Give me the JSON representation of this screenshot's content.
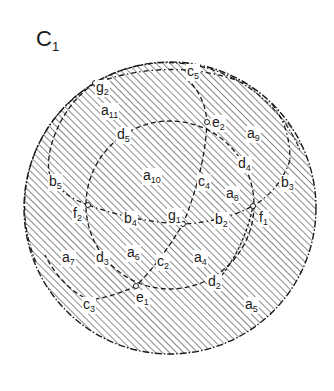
{
  "title": {
    "main": "C",
    "sub": "1"
  },
  "colors": {
    "ink": "#1a1a1a",
    "hatch": "#2a2a2a",
    "background": "#ffffff"
  },
  "labels": [
    {
      "id": "g2",
      "main": "g",
      "sub": "2",
      "x": 95,
      "y": 80
    },
    {
      "id": "c5",
      "main": "c",
      "sub": "5",
      "x": 186,
      "y": 68
    },
    {
      "id": "a11",
      "main": "a",
      "sub": "11",
      "x": 100,
      "y": 103
    },
    {
      "id": "e2",
      "main": "e",
      "sub": "2",
      "x": 211,
      "y": 116
    },
    {
      "id": "a9",
      "main": "a",
      "sub": "9",
      "x": 246,
      "y": 126
    },
    {
      "id": "d5",
      "main": "d",
      "sub": "5",
      "x": 116,
      "y": 127
    },
    {
      "id": "d4",
      "main": "d",
      "sub": "4",
      "x": 237,
      "y": 158
    },
    {
      "id": "b5",
      "main": "b",
      "sub": "5",
      "x": 49,
      "y": 176
    },
    {
      "id": "a10",
      "main": "a",
      "sub": "10",
      "x": 142,
      "y": 168
    },
    {
      "id": "c4",
      "main": "c",
      "sub": "4",
      "x": 197,
      "y": 175
    },
    {
      "id": "b3",
      "main": "b",
      "sub": "3",
      "x": 280,
      "y": 176
    },
    {
      "id": "a8",
      "main": "a",
      "sub": "8",
      "x": 225,
      "y": 186
    },
    {
      "id": "f2",
      "main": "f",
      "sub": "2",
      "x": 73,
      "y": 207
    },
    {
      "id": "b4",
      "main": "b",
      "sub": "4",
      "x": 123,
      "y": 212
    },
    {
      "id": "g1",
      "main": "g",
      "sub": "1",
      "x": 168,
      "y": 210
    },
    {
      "id": "b2",
      "main": "b",
      "sub": "2",
      "x": 215,
      "y": 213
    },
    {
      "id": "f1",
      "main": "f",
      "sub": "1",
      "x": 258,
      "y": 211
    },
    {
      "id": "a7",
      "main": "a",
      "sub": "7",
      "x": 61,
      "y": 250
    },
    {
      "id": "d3",
      "main": "d",
      "sub": "3",
      "x": 95,
      "y": 250
    },
    {
      "id": "a6",
      "main": "a",
      "sub": "6",
      "x": 126,
      "y": 246
    },
    {
      "id": "c2",
      "main": "c",
      "sub": "2",
      "x": 157,
      "y": 255
    },
    {
      "id": "a4",
      "main": "a",
      "sub": "4",
      "x": 193,
      "y": 250
    },
    {
      "id": "d2",
      "main": "d",
      "sub": "2",
      "x": 207,
      "y": 275
    },
    {
      "id": "e1",
      "main": "e",
      "sub": "1",
      "x": 136,
      "y": 291
    },
    {
      "id": "c3",
      "main": "c",
      "sub": "3",
      "x": 83,
      "y": 298
    },
    {
      "id": "a5",
      "main": "a",
      "sub": "5",
      "x": 244,
      "y": 297
    }
  ],
  "nodes": [
    {
      "id": "g2",
      "x": 95,
      "y": 83
    },
    {
      "id": "e2",
      "x": 207,
      "y": 122
    },
    {
      "id": "f2",
      "x": 88,
      "y": 205
    },
    {
      "id": "g1",
      "x": 183,
      "y": 224
    },
    {
      "id": "f1",
      "x": 253,
      "y": 206
    },
    {
      "id": "e1",
      "x": 136,
      "y": 286
    }
  ]
}
